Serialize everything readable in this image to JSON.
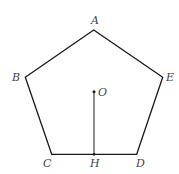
{
  "figure": {
    "type": "regular-pentagon",
    "stroke_color": "#1a1a1a",
    "label_color": "#444444",
    "vertices": [
      {
        "name": "A",
        "x": 93.7,
        "y": 30.0
      },
      {
        "name": "B",
        "x": 25.3,
        "y": 77.3
      },
      {
        "name": "C",
        "x": 51.7,
        "y": 154.3
      },
      {
        "name": "D",
        "x": 136.7,
        "y": 154.3
      },
      {
        "name": "E",
        "x": 162.7,
        "y": 77.3
      }
    ],
    "center": {
      "name": "O",
      "x": 94.0,
      "y": 91.7
    },
    "foot": {
      "name": "H",
      "x": 94.0,
      "y": 154.3
    },
    "segment": {
      "from": "O",
      "to": "H"
    },
    "labels": {
      "A": "A",
      "B": "B",
      "C": "C",
      "D": "D",
      "E": "E",
      "O": "O",
      "H": "H"
    }
  }
}
